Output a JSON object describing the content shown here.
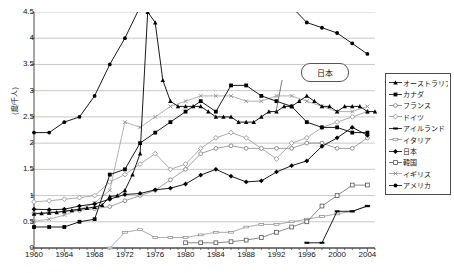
{
  "chart_data": {
    "type": "line",
    "title": "",
    "xlabel": "",
    "ylabel": "(度/千人)",
    "xlim": [
      1960,
      2005
    ],
    "ylim": [
      0,
      4.5
    ],
    "ytick_step": 0.5,
    "xtick_step": 4,
    "grid": true,
    "legend_position": "right-outside",
    "xticks": [
      "1960",
      "1964",
      "1968",
      "1972",
      "1976",
      "1980",
      "1984",
      "1988",
      "1992",
      "1996",
      "2000",
      "2004"
    ],
    "yticks": [
      "0",
      "0.5",
      "1",
      "1.5",
      "2",
      "2.5",
      "3",
      "3.5",
      "4",
      "4.5"
    ],
    "annotations": [
      {
        "text": "日本",
        "x": 1993,
        "y": 3.55,
        "target_x": 1993,
        "target_y": 2.6
      }
    ],
    "series": [
      {
        "name": "オーストラリア",
        "marker": "filled-triangle",
        "color": "#000000",
        "x": [
          1960,
          1961,
          1962,
          1963,
          1964,
          1965,
          1966,
          1967,
          1968,
          1969,
          1970,
          1971,
          1972,
          1973,
          1974,
          1975,
          1976,
          1977,
          1978,
          1979,
          1980,
          1981,
          1982,
          1983,
          1984,
          1985,
          1986,
          1987,
          1988,
          1989,
          1990,
          1991,
          1992,
          1993,
          1994,
          1995,
          1996,
          1997,
          1998,
          1999,
          2000,
          2001,
          2002,
          2003,
          2004,
          2005
        ],
        "values": [
          0.65,
          0.66,
          0.67,
          0.68,
          0.7,
          0.72,
          0.74,
          0.76,
          0.78,
          0.82,
          0.98,
          1.0,
          1.1,
          1.4,
          1.8,
          4.5,
          4.3,
          3.2,
          2.8,
          2.7,
          2.7,
          2.7,
          2.7,
          2.6,
          2.5,
          2.5,
          2.5,
          2.4,
          2.4,
          2.4,
          2.5,
          2.6,
          2.6,
          2.7,
          2.7,
          2.8,
          2.9,
          2.8,
          2.7,
          2.7,
          2.6,
          2.7,
          2.7,
          2.7,
          2.6,
          2.6
        ]
      },
      {
        "name": "カナダ",
        "marker": "filled-square",
        "color": "#000000",
        "x": [
          1960,
          1962,
          1964,
          1966,
          1968,
          1970,
          1972,
          1974,
          1976,
          1978,
          1980,
          1982,
          1984,
          1986,
          1988,
          1990,
          1992,
          1994,
          1996,
          1998,
          2000,
          2002,
          2004
        ],
        "values": [
          0.4,
          0.4,
          0.4,
          0.5,
          0.55,
          1.4,
          1.5,
          2.0,
          2.2,
          2.4,
          2.6,
          2.8,
          2.6,
          3.1,
          3.1,
          2.9,
          2.8,
          2.7,
          2.4,
          2.3,
          2.3,
          2.2,
          2.2
        ]
      },
      {
        "name": "フランス",
        "marker": "open-circle",
        "color": "#777777",
        "x": [
          1960,
          1962,
          1964,
          1966,
          1968,
          1970,
          1972,
          1974,
          1976,
          1978,
          1980,
          1982,
          1984,
          1986,
          1988,
          1990,
          1992,
          1994,
          1996,
          1998,
          2000,
          2002,
          2004
        ],
        "values": [
          0.66,
          0.68,
          0.7,
          0.72,
          0.75,
          0.79,
          0.9,
          1.0,
          1.1,
          1.3,
          1.5,
          1.8,
          1.9,
          1.95,
          1.9,
          1.9,
          1.9,
          1.9,
          2.0,
          2.0,
          1.9,
          1.9,
          2.1
        ]
      },
      {
        "name": "ドイツ",
        "marker": "open-diamond",
        "color": "#8a8a8a",
        "x": [
          1960,
          1962,
          1964,
          1966,
          1968,
          1970,
          1972,
          1974,
          1976,
          1978,
          1980,
          1982,
          1984,
          1986,
          1988,
          1990,
          1992,
          1994,
          1996,
          1998,
          2000,
          2002,
          2004
        ],
        "values": [
          0.88,
          0.9,
          0.93,
          0.96,
          1.0,
          1.26,
          1.4,
          1.6,
          1.8,
          1.5,
          1.6,
          1.9,
          2.1,
          2.2,
          2.1,
          1.9,
          1.7,
          2.0,
          2.1,
          2.3,
          2.4,
          2.5,
          2.6
        ]
      },
      {
        "name": "アイルランド",
        "marker": "filled-dash",
        "color": "#000000",
        "x": [
          1996,
          1998,
          2000,
          2002,
          2004
        ],
        "values": [
          0.1,
          0.1,
          0.7,
          0.7,
          0.8
        ]
      },
      {
        "name": "イタリア",
        "marker": "open-dash",
        "color": "#888888",
        "x": [
          1970,
          1972,
          1974,
          1976,
          1978,
          1980,
          1982,
          1984,
          1986,
          1988,
          1990,
          1992,
          1994,
          1996,
          1998,
          2000,
          2002,
          2004
        ],
        "values": [
          0.0,
          0.3,
          0.35,
          0.2,
          0.2,
          0.2,
          0.25,
          0.3,
          0.3,
          0.4,
          0.45,
          0.45,
          0.5,
          0.55,
          0.6,
          0.65,
          0.7,
          0.8
        ]
      },
      {
        "name": "日本",
        "marker": "filled-diamond",
        "color": "#000000",
        "x": [
          1960,
          1962,
          1964,
          1966,
          1968,
          1970,
          1972,
          1974,
          1976,
          1978,
          1980,
          1982,
          1984,
          1986,
          1988,
          1990,
          1992,
          1994,
          1996,
          1998,
          2000,
          2002,
          2004
        ],
        "values": [
          0.74,
          0.73,
          0.74,
          0.8,
          0.84,
          0.93,
          1.02,
          1.04,
          1.11,
          1.14,
          1.22,
          1.39,
          1.5,
          1.37,
          1.26,
          1.28,
          1.45,
          1.57,
          1.66,
          1.94,
          2.1,
          2.3,
          2.15
        ]
      },
      {
        "name": "韓国",
        "marker": "open-square",
        "color": "#555555",
        "x": [
          1980,
          1982,
          1984,
          1986,
          1988,
          1990,
          1992,
          1994,
          1996,
          1998,
          2000,
          2002,
          2004
        ],
        "values": [
          0.1,
          0.1,
          0.1,
          0.12,
          0.15,
          0.2,
          0.3,
          0.4,
          0.5,
          0.8,
          1.0,
          1.2,
          1.2
        ]
      },
      {
        "name": "イギリス",
        "marker": "open-x",
        "color": "#909090",
        "x": [
          1960,
          1962,
          1964,
          1966,
          1968,
          1970,
          1972,
          1974,
          1976,
          1978,
          1980,
          1982,
          1984,
          1986,
          1988,
          1990,
          1992,
          1994,
          1996,
          1998,
          2000,
          2002,
          2004
        ],
        "values": [
          0.51,
          0.55,
          0.63,
          0.73,
          0.86,
          1.1,
          2.4,
          2.3,
          2.5,
          2.7,
          2.8,
          2.9,
          2.9,
          2.9,
          2.8,
          2.8,
          2.9,
          2.9,
          2.8,
          2.7,
          2.6,
          2.6,
          2.7
        ]
      },
      {
        "name": "アメリカ",
        "marker": "filled-dot",
        "color": "#000000",
        "x": [
          1960,
          1962,
          1964,
          1966,
          1968,
          1970,
          1972,
          1974,
          1976,
          1978,
          1980,
          1982,
          1984,
          1986,
          1988,
          1990,
          1992,
          1994,
          1996,
          1998,
          2000,
          2002,
          2004
        ],
        "values": [
          2.2,
          2.2,
          2.4,
          2.5,
          2.9,
          3.5,
          4.0,
          4.6,
          5.0,
          5.1,
          5.2,
          5.0,
          4.9,
          4.8,
          4.7,
          4.7,
          4.7,
          4.6,
          4.3,
          4.2,
          4.1,
          3.9,
          3.7
        ]
      }
    ]
  },
  "legend": {
    "items": [
      {
        "label": "オーストラリア",
        "marker": "filled-triangle"
      },
      {
        "label": "カナダ",
        "marker": "filled-square"
      },
      {
        "label": "フランス",
        "marker": "open-circle"
      },
      {
        "label": "ドイツ",
        "marker": "open-diamond"
      },
      {
        "label": "アイルランド",
        "marker": "filled-dash"
      },
      {
        "label": "イタリア",
        "marker": "open-dash"
      },
      {
        "label": "日本",
        "marker": "filled-diamond"
      },
      {
        "label": "韓国",
        "marker": "open-square"
      },
      {
        "label": "イギリス",
        "marker": "open-x"
      },
      {
        "label": "アメリカ",
        "marker": "filled-dot"
      }
    ]
  },
  "callout": {
    "label": "日本"
  },
  "colors": {
    "grid": "#b9b9b9",
    "axis": "#4a4a4a",
    "dark_series": "#000000",
    "light_series": "#8a8a8a",
    "background": "#ffffff"
  }
}
